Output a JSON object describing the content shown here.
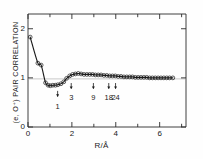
{
  "chart_data": {
    "type": "scatter",
    "title": "",
    "subtitle": "",
    "xlabel": "R/Å",
    "ylabel": "(e, O⁺) PAIR CORRELATION",
    "xlim": [
      0,
      7.2
    ],
    "ylim": [
      0,
      2.3
    ],
    "xticks": [
      0,
      1,
      2,
      3,
      4,
      5,
      6,
      7
    ],
    "xtick_labels": [
      "0",
      "",
      "2",
      "",
      "4",
      "",
      "6",
      ""
    ],
    "yticks": [
      0,
      1,
      2
    ],
    "ytick_labels": [
      "0",
      "1",
      "2"
    ],
    "grid": false,
    "legend_position": "none",
    "reference_line_y": 1.0,
    "series": [
      {
        "name": "(e, O+) pair correlation",
        "marker": "open-circle",
        "line": "solid-guide",
        "x": [
          0.1,
          0.45,
          0.6,
          0.8,
          0.92,
          1.02,
          1.13,
          1.25,
          1.36,
          1.5,
          1.63,
          1.76,
          1.9,
          2.03,
          2.16,
          2.29,
          2.42,
          2.55,
          2.68,
          2.81,
          2.94,
          3.07,
          3.2,
          3.33,
          3.46,
          3.59,
          3.72,
          3.85,
          3.98,
          4.11,
          4.24,
          4.37,
          4.5,
          4.63,
          4.76,
          4.89,
          5.02,
          5.15,
          5.28,
          5.41,
          5.54,
          5.67,
          5.8,
          5.93,
          6.06,
          6.19,
          6.32,
          6.45,
          6.6
        ],
        "y": [
          1.83,
          1.3,
          1.26,
          0.9,
          0.85,
          0.84,
          0.85,
          0.85,
          0.86,
          0.88,
          0.92,
          0.99,
          1.04,
          1.07,
          1.08,
          1.09,
          1.08,
          1.07,
          1.07,
          1.07,
          1.07,
          1.06,
          1.06,
          1.06,
          1.05,
          1.05,
          1.04,
          1.04,
          1.04,
          1.03,
          1.03,
          1.02,
          1.02,
          1.02,
          1.02,
          1.01,
          1.01,
          1.01,
          1.01,
          1.01,
          1.0,
          1.0,
          1.0,
          1.0,
          1.0,
          1.0,
          1.0,
          1.0,
          1.0
        ]
      }
    ],
    "annotations": [
      {
        "label": "1",
        "x": 1.35,
        "arrow_y": 0.62,
        "label_y": 0.4
      },
      {
        "label": "3",
        "x": 1.97,
        "arrow_y": 0.78,
        "label_y": 0.6
      },
      {
        "label": "9",
        "x": 2.98,
        "arrow_y": 0.78,
        "label_y": 0.6
      },
      {
        "label": "18",
        "x": 3.68,
        "arrow_y": 0.78,
        "label_y": 0.6
      },
      {
        "label": "24",
        "x": 3.99,
        "arrow_y": 0.78,
        "label_y": 0.6
      }
    ]
  }
}
